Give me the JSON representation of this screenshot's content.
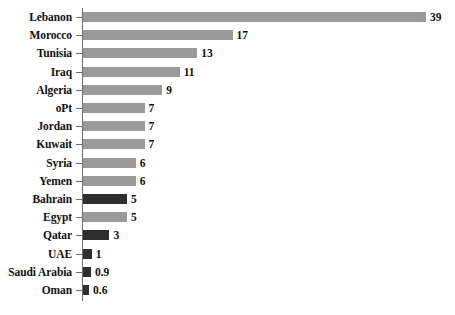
{
  "chart_data": {
    "type": "bar",
    "orientation": "horizontal",
    "title": "",
    "subtitle": "",
    "xlabel": "",
    "ylabel": "",
    "xlim": [
      0,
      39
    ],
    "grid": false,
    "legend": null,
    "categories": [
      "Lebanon",
      "Morocco",
      "Tunisia",
      "Iraq",
      "Algeria",
      "oPt",
      "Jordan",
      "Kuwait",
      "Syria",
      "Yemen",
      "Bahrain",
      "Egypt",
      "Qatar",
      "UAE",
      "Saudi Arabia",
      "Oman"
    ],
    "values": [
      39,
      17,
      13,
      11,
      9,
      7,
      7,
      7,
      6,
      6,
      5,
      5,
      3,
      1,
      0.9,
      0.6
    ],
    "value_labels": [
      "39",
      "17",
      "13",
      "11",
      "9",
      "7",
      "7",
      "7",
      "6",
      "6",
      "5",
      "5",
      "3",
      "1",
      "0.9",
      "0.6"
    ],
    "bar_colors": [
      "light",
      "light",
      "light",
      "light",
      "light",
      "light",
      "light",
      "light",
      "light",
      "light",
      "dark",
      "light",
      "dark",
      "dark",
      "dark",
      "dark"
    ],
    "colors": {
      "light": "#9a9a9a",
      "dark": "#2e2e2e",
      "axis": "#6e6e6e",
      "text": "#111111",
      "background": "#ffffff"
    }
  }
}
